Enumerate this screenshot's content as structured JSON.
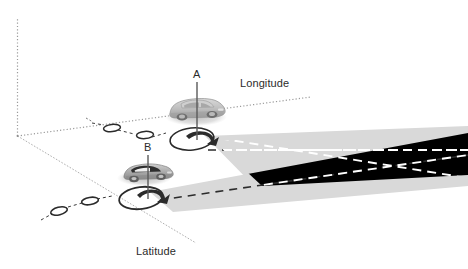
{
  "figure": {
    "type": "technical-diagram",
    "background_color": "#ffffff"
  },
  "axes": {
    "vertical": {
      "name": "vertical-axis",
      "style": "dotted",
      "color": "#9a9a9a"
    },
    "longitude": {
      "label": "Longitude",
      "name": "longitude-axis",
      "style": "dotted",
      "color": "#9a9a9a"
    },
    "latitude": {
      "label": "Latitude",
      "name": "latitude-axis",
      "style": "solid-thin",
      "color": "#9a9a9a"
    },
    "origin_marker": "origin"
  },
  "nodes": [
    {
      "id": "A",
      "label": "A",
      "kind": "vehicle",
      "vehicle_color": "#b8b8b8",
      "has_pointer_line": true,
      "has_uncertainty_ellipse": true,
      "has_rotation_arrow": true
    },
    {
      "id": "B",
      "label": "B",
      "kind": "vehicle",
      "vehicle_color": "#9a9a9a",
      "has_pointer_line": true,
      "has_uncertainty_ellipse": true,
      "has_rotation_arrow": true
    }
  ],
  "beams": [
    {
      "source": "A",
      "name": "beam-a",
      "fill": "#d9d9d9",
      "centerline": "dashed",
      "centerline_color": "#2b2b2b"
    },
    {
      "source": "B",
      "name": "beam-b",
      "fill": "#d9d9d9",
      "centerline": "dashed",
      "centerline_color": "#2b2b2b"
    }
  ],
  "overlap_region": {
    "name": "beam-overlap-region",
    "fill": "#000000",
    "centerline_color": "#ffffff",
    "centerline": "dashed"
  },
  "trajectories": [
    {
      "name": "trajectory-longitude",
      "marker": "ellipse",
      "marker_count": 3,
      "link_style": "dashed",
      "color": "#3a3a3a"
    },
    {
      "name": "trajectory-latitude",
      "marker": "ellipse",
      "marker_count": 3,
      "link_style": "dashed",
      "color": "#3a3a3a"
    }
  ],
  "colors": {
    "axis": "#9a9a9a",
    "beam": "#d9d9d9",
    "overlap": "#000000",
    "ink": "#2b2b2b",
    "vehicle_body": "#bdbdbd",
    "vehicle_shadow": "#c9c9c9"
  }
}
